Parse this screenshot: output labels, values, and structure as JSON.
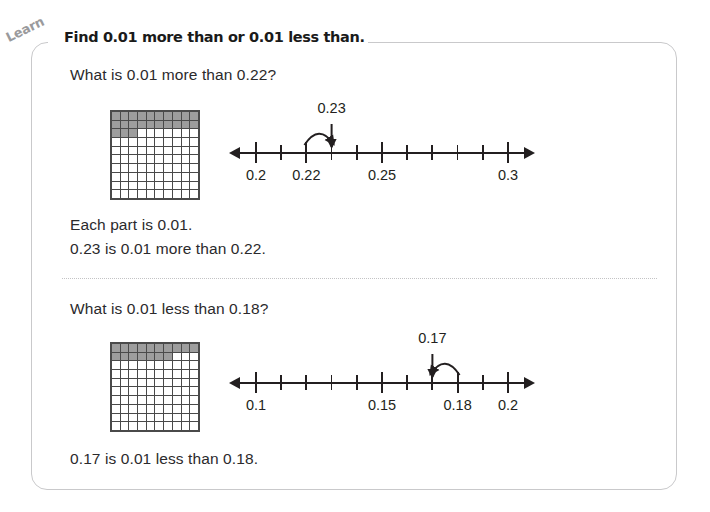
{
  "badge": {
    "label": "Learn"
  },
  "header": {
    "title": "Find 0.01 more than or 0.01 less than."
  },
  "sections": [
    {
      "question": "What is 0.01 more than 0.22?",
      "grid": {
        "shaded": 23,
        "total": 100,
        "shaded_color": "#9d9d9d"
      },
      "numberline": {
        "min": 0.2,
        "max": 0.3,
        "step": 0.01,
        "tick_count": 11,
        "labels": [
          {
            "value": 0.2,
            "text": "0.2"
          },
          {
            "value": 0.22,
            "text": "0.22"
          },
          {
            "value": 0.25,
            "text": "0.25"
          },
          {
            "value": 0.3,
            "text": "0.3"
          }
        ],
        "major_ticks": [
          0.2,
          0.22,
          0.25,
          0.3
        ],
        "callout": {
          "text": "0.23",
          "value": 0.23,
          "arrow_direction": "right",
          "from_value": 0.22
        }
      },
      "statements": [
        "Each part is 0.01.",
        "0.23 is 0.01 more than 0.22."
      ]
    },
    {
      "question": "What is 0.01 less than 0.18?",
      "grid": {
        "shaded": 17,
        "total": 100,
        "shaded_color": "#9d9d9d"
      },
      "numberline": {
        "min": 0.1,
        "max": 0.2,
        "step": 0.01,
        "tick_count": 11,
        "labels": [
          {
            "value": 0.1,
            "text": "0.1"
          },
          {
            "value": 0.15,
            "text": "0.15"
          },
          {
            "value": 0.18,
            "text": "0.18"
          },
          {
            "value": 0.2,
            "text": "0.2"
          }
        ],
        "major_ticks": [
          0.1,
          0.15,
          0.18,
          0.2
        ],
        "callout": {
          "text": "0.17",
          "value": 0.17,
          "arrow_direction": "left",
          "from_value": 0.18
        }
      },
      "statements": [
        "0.17 is 0.01 less than 0.18."
      ]
    }
  ],
  "chart_data": {
    "type": "table",
    "title": "Find 0.01 more than or 0.01 less than.",
    "items": [
      {
        "prompt": "What is 0.01 more than 0.22?",
        "model": "hundredths grid",
        "grid_shaded": 23,
        "grid_total": 100,
        "number_line_range": [
          0.2,
          0.3
        ],
        "number_line_step": 0.01,
        "tick_labels": [
          "0.2",
          "0.22",
          "0.25",
          "0.3"
        ],
        "marked_value": 0.23,
        "answer": "0.23"
      },
      {
        "prompt": "What is 0.01 less than 0.18?",
        "model": "hundredths grid",
        "grid_shaded": 17,
        "grid_total": 100,
        "number_line_range": [
          0.1,
          0.2
        ],
        "number_line_step": 0.01,
        "tick_labels": [
          "0.1",
          "0.15",
          "0.18",
          "0.2"
        ],
        "marked_value": 0.17,
        "answer": "0.17"
      }
    ]
  }
}
